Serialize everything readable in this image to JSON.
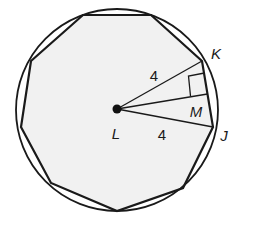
{
  "diagram": {
    "type": "geometry",
    "colors": {
      "stroke": "#1a1a1a",
      "fill": "#f1f1f1",
      "background": "#ffffff"
    },
    "circle": {
      "cx": 117,
      "cy": 110,
      "r": 101
    },
    "polygon_points": "83,15 151,15 202,61 213,127 183,188 117,211 51,183 21,127 31,61",
    "center_point": {
      "label": "L",
      "x": 117,
      "y": 109
    },
    "points": {
      "K": {
        "label": "K",
        "x": 202,
        "y": 61
      },
      "J": {
        "label": "J",
        "x": 213,
        "y": 127
      },
      "M": {
        "label": "M",
        "x": 207.5,
        "y": 94
      }
    },
    "segments": [
      {
        "name": "LK",
        "length_label": "4"
      },
      {
        "name": "LJ",
        "length_label": "4"
      },
      {
        "name": "LM",
        "note": "apothem, perpendicular to KJ"
      }
    ],
    "labels": {
      "K": "K",
      "J": "J",
      "M": "M",
      "L": "L",
      "lk_length": "4",
      "lj_length": "4"
    }
  }
}
